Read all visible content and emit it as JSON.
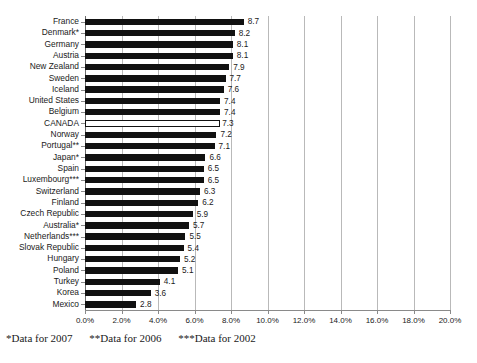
{
  "chart_data": {
    "type": "bar",
    "orientation": "horizontal",
    "title": "",
    "xlabel": "",
    "ylabel": "",
    "xlim": [
      0,
      20
    ],
    "xtick_labels": [
      "0.0%",
      "2.0%",
      "4.0%",
      "6.0%",
      "8.0%",
      "10.0%",
      "12.0%",
      "14.0%",
      "16.0%",
      "18.0%",
      "20.0%"
    ],
    "xtick_values": [
      0,
      2,
      4,
      6,
      8,
      10,
      12,
      14,
      16,
      18,
      20
    ],
    "grid": true,
    "grid_axis": "x",
    "legend": "none",
    "value_labels": true,
    "categories": [
      "France",
      "Denmark*",
      "Germany",
      "Austria",
      "New Zealand",
      "Sweden",
      "Iceland",
      "United States",
      "Belgium",
      "CANADA",
      "Norway",
      "Portugal**",
      "Japan*",
      "Spain",
      "Luxembourg***",
      "Switzerland",
      "Finland",
      "Czech Republic",
      "Australia*",
      "Netherlands***",
      "Slovak Republic",
      "Hungary",
      "Poland",
      "Turkey",
      "Korea",
      "Mexico"
    ],
    "values": [
      8.7,
      8.2,
      8.1,
      8.1,
      7.9,
      7.7,
      7.6,
      7.4,
      7.4,
      7.3,
      7.2,
      7.1,
      6.6,
      6.5,
      6.5,
      6.3,
      6.2,
      5.9,
      5.7,
      5.5,
      5.4,
      5.2,
      5.1,
      4.1,
      3.6,
      2.8
    ],
    "value_label_text": [
      "8.7",
      "8.2",
      "8.1",
      "8.1",
      "7.9",
      "7.7",
      "7.6",
      "7.4",
      "7.4",
      "7.3",
      "7.2",
      "7.1",
      "6.6",
      "6.5",
      "6.5",
      "6.3",
      "6.2",
      "5.9",
      "5.7",
      "5.5",
      "5.4",
      "5.2",
      "5.1",
      "4.1",
      "3.6",
      "2.8"
    ],
    "highlight_category": "CANADA",
    "highlight_style": "hollow-white-bar-with-black-outline",
    "bar_color": "#111111",
    "highlight_bar_fill": "#ffffff",
    "highlight_bar_stroke": "#111111",
    "gridline_color": "#b9b9b9",
    "axis_color": "#8a8a8a"
  },
  "footnotes": [
    "*Data for 2007",
    "**Data for 2006",
    "***Data for 2002"
  ],
  "ghost_text": {
    "top": "",
    "bottom": ""
  }
}
